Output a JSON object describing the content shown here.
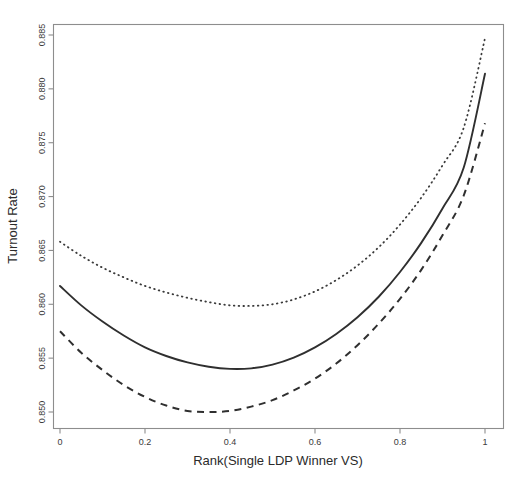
{
  "chart_data": {
    "type": "line",
    "title": "",
    "xlabel": "Rank(Single LDP Winner VS)",
    "ylabel": "Turnout Rate",
    "xlim": [
      0.0,
      1.0
    ],
    "ylim": [
      0.8495,
      0.8858
    ],
    "grid": false,
    "legend": null,
    "xticks": [
      0,
      0.2,
      0.4,
      0.6,
      0.8,
      1
    ],
    "xtick_labels": [
      "0",
      "0.2",
      "0.4",
      "0.6",
      "0.8",
      "1"
    ],
    "yticks": [
      0.85,
      0.855,
      0.86,
      0.865,
      0.87,
      0.875,
      0.88,
      0.885
    ],
    "ytick_labels": [
      "0.850",
      "0.855",
      "0.860",
      "0.865",
      "0.870",
      "0.875",
      "0.880",
      "0.885"
    ],
    "x": [
      0.0,
      0.05,
      0.1,
      0.15,
      0.2,
      0.25,
      0.3,
      0.35,
      0.4,
      0.45,
      0.5,
      0.55,
      0.6,
      0.65,
      0.7,
      0.75,
      0.8,
      0.85,
      0.9,
      0.95,
      1.0
    ],
    "series": [
      {
        "name": "Upper confidence band",
        "style": "dotted",
        "values": [
          0.8658,
          0.8645,
          0.8634,
          0.8625,
          0.8617,
          0.8611,
          0.8606,
          0.8602,
          0.8599,
          0.85985,
          0.86,
          0.86045,
          0.8612,
          0.86225,
          0.8636,
          0.8653,
          0.8674,
          0.8699,
          0.8729,
          0.8764,
          0.8847
        ]
      },
      {
        "name": "Fitted turnout rate",
        "style": "solid",
        "values": [
          0.8617,
          0.8599,
          0.8584,
          0.8571,
          0.856,
          0.8552,
          0.8546,
          0.8542,
          0.854,
          0.85405,
          0.8544,
          0.85505,
          0.856,
          0.85725,
          0.8588,
          0.8607,
          0.863,
          0.8657,
          0.8689,
          0.8727,
          0.8814
        ]
      },
      {
        "name": "Lower confidence band",
        "style": "dashed",
        "values": [
          0.8575,
          0.8555,
          0.8539,
          0.8525,
          0.8514,
          0.8506,
          0.8501,
          0.85,
          0.8501,
          0.8505,
          0.8511,
          0.852,
          0.8531,
          0.8545,
          0.8562,
          0.8582,
          0.8605,
          0.8632,
          0.8664,
          0.8701,
          0.8768
        ]
      }
    ]
  },
  "axes": {
    "x_title": "Rank(Single LDP Winner VS)",
    "y_title": "Turnout Rate"
  }
}
